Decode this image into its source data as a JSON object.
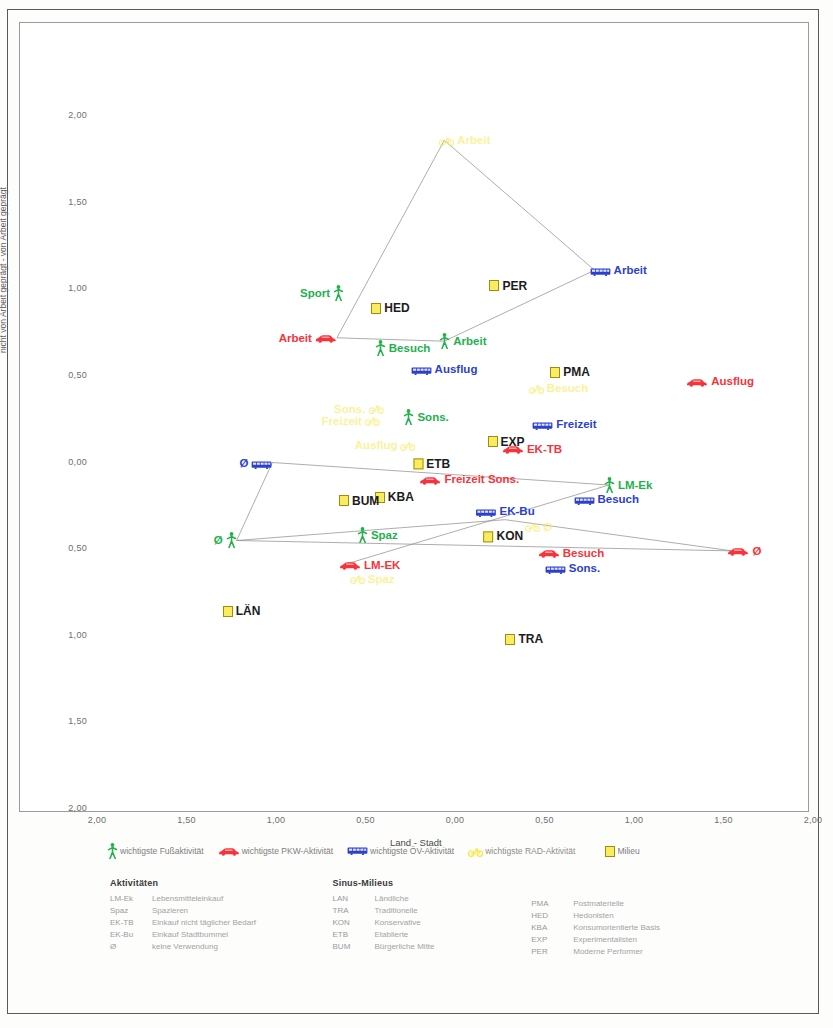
{
  "axes": {
    "x_label": "Land - Stadt",
    "y_label": "nicht von Arbeit geprägt - von Arbeit geprägt",
    "x_ticks": [
      "2,00",
      "1,50",
      "1,00",
      "0,50",
      "0,00",
      "0,50",
      "1,00",
      "1,50",
      "2,00"
    ],
    "y_ticks": [
      "2,00",
      "1,50",
      "1,00",
      "0,50",
      "0,00",
      "0,50",
      "1,00",
      "1,50",
      "2,00"
    ]
  },
  "legend": {
    "items": [
      {
        "icon": "pedestrian-icon",
        "label": "wichtigste Fußaktivität",
        "color": "#22b14c"
      },
      {
        "icon": "car-icon",
        "label": "wichtigste PKW-Aktivität",
        "color": "#f8333c"
      },
      {
        "icon": "bus-icon",
        "label": "wichtigste ÖV-Aktivität",
        "color": "#2b3fd0"
      },
      {
        "icon": "bicycle-icon",
        "label": "wichtigste RAD-Aktivität",
        "color": "#f7e84a"
      },
      {
        "icon": "yellow-square-icon",
        "label": "Milieu",
        "color": "#fbec5d"
      }
    ]
  },
  "tables": {
    "activities": {
      "title": "Aktivitäten",
      "rows": [
        {
          "key": "LM-Ek",
          "val": "Lebensmitteleinkauf"
        },
        {
          "key": "Spaz",
          "val": "Spazieren"
        },
        {
          "key": "EK-TB",
          "val": "Einkauf nicht täglicher Bedarf"
        },
        {
          "key": "EK-Bu",
          "val": "Einkauf Stadtbummel"
        },
        {
          "key": "Ø",
          "val": "keine Verwendung"
        }
      ]
    },
    "milieus": {
      "title": "Sinus-Milieus",
      "rows_left": [
        {
          "key": "LAN",
          "val": "Ländliche"
        },
        {
          "key": "TRA",
          "val": "Traditionelle"
        },
        {
          "key": "KON",
          "val": "Konservative"
        },
        {
          "key": "ETB",
          "val": "Etablierte"
        },
        {
          "key": "BUM",
          "val": "Bürgerliche Mitte"
        }
      ],
      "rows_right": [
        {
          "key": "PMA",
          "val": "Postmaterielle"
        },
        {
          "key": "HED",
          "val": "Hedonisten"
        },
        {
          "key": "KBA",
          "val": "Konsumorientierte Basis"
        },
        {
          "key": "EXP",
          "val": "Experimentalisten"
        },
        {
          "key": "PER",
          "val": "Moderne Performer"
        }
      ]
    }
  },
  "chart_data": {
    "type": "scatter",
    "title": "",
    "xlabel": "Land - Stadt",
    "ylabel": "nicht von Arbeit geprägt - von Arbeit geprägt",
    "xlim": [
      -2.0,
      2.0
    ],
    "ylim": [
      -2.0,
      2.0
    ],
    "grid": false,
    "note": "x axis runs Land(left,-2) to Stadt(right,+2); y axis runs von Arbeit geprägt(top,+2) to nicht von Arbeit geprägt(bottom,-2). Tick labels are printed as unsigned magnitudes on both sides of zero.",
    "series": [
      {
        "name": "wichtigste Fußaktivität",
        "icon": "pedestrian-icon",
        "color": "#22b14c",
        "points": [
          {
            "label": "Sport",
            "x": -0.62,
            "y": 0.98,
            "side": "left"
          },
          {
            "label": "Besuch",
            "x": -0.42,
            "y": 0.66,
            "side": "right"
          },
          {
            "label": "Arbeit",
            "x": -0.06,
            "y": 0.7,
            "side": "right"
          },
          {
            "label": "Sons.",
            "x": -0.26,
            "y": 0.26,
            "side": "right"
          },
          {
            "label": "LM-Ek",
            "x": 0.86,
            "y": -0.13,
            "side": "right"
          },
          {
            "label": "Spaz",
            "x": -0.52,
            "y": -0.42,
            "side": "right"
          },
          {
            "label": "Ø",
            "x": -1.22,
            "y": -0.45,
            "side": "left"
          }
        ]
      },
      {
        "name": "wichtigste PKW-Aktivität",
        "icon": "car-icon",
        "color": "#f8333c",
        "points": [
          {
            "label": "Arbeit",
            "x": -0.66,
            "y": 0.72,
            "side": "left"
          },
          {
            "label": "Ausflug",
            "x": 1.32,
            "y": 0.47,
            "side": "right"
          },
          {
            "label": "EK-TB",
            "x": 0.29,
            "y": 0.08,
            "side": "right"
          },
          {
            "label": "Freizeit Sons.",
            "x": 0.08,
            "y": -0.15,
            "side": "top"
          },
          {
            "label": "Besuch",
            "x": 0.49,
            "y": -0.52,
            "side": "right"
          },
          {
            "label": "Ø",
            "x": 1.55,
            "y": -0.51,
            "side": "right"
          },
          {
            "label": "LM-EK",
            "x": -0.62,
            "y": -0.59,
            "side": "right"
          }
        ]
      },
      {
        "name": "wichtigste ÖV-Aktivität",
        "icon": "bus-icon",
        "color": "#2b3fd0",
        "points": [
          {
            "label": "Arbeit",
            "x": 0.78,
            "y": 1.11,
            "side": "right"
          },
          {
            "label": "Ausflug",
            "x": -0.22,
            "y": 0.54,
            "side": "right"
          },
          {
            "label": "Freizeit",
            "x": 0.46,
            "y": 0.22,
            "side": "right"
          },
          {
            "label": "Ø",
            "x": -1.02,
            "y": 0.0,
            "side": "left"
          },
          {
            "label": "Besuch",
            "x": 0.69,
            "y": -0.21,
            "side": "right"
          },
          {
            "label": "EK-Bu",
            "x": 0.28,
            "y": -0.33,
            "side": "top"
          },
          {
            "label": "Sons.",
            "x": 0.53,
            "y": -0.61,
            "side": "right"
          }
        ]
      },
      {
        "name": "wichtigste RAD-Aktivität",
        "icon": "bicycle-icon",
        "color": "#f7e84a",
        "points": [
          {
            "label": "Arbeit",
            "x": -0.06,
            "y": 1.86,
            "side": "right"
          },
          {
            "label": "Besuch",
            "x": 0.44,
            "y": 0.43,
            "side": "right"
          },
          {
            "label": "Sons.",
            "x": -0.4,
            "y": 0.31,
            "side": "left"
          },
          {
            "label": "Freizeit",
            "x": -0.42,
            "y": 0.24,
            "side": "left"
          },
          {
            "label": "Ausflug",
            "x": -0.22,
            "y": 0.1,
            "side": "left"
          },
          {
            "label": "Ø",
            "x": 0.42,
            "y": -0.37,
            "side": "right"
          },
          {
            "label": "Spaz",
            "x": -0.56,
            "y": -0.67,
            "side": "right"
          }
        ]
      },
      {
        "name": "Milieu",
        "icon": "yellow-square-icon",
        "color": "#fbec5d",
        "points": [
          {
            "label": "PER",
            "x": 0.22,
            "y": 1.02,
            "side": "right"
          },
          {
            "label": "HED",
            "x": -0.44,
            "y": 0.89,
            "side": "right"
          },
          {
            "label": "PMA",
            "x": 0.56,
            "y": 0.52,
            "side": "right"
          },
          {
            "label": "EXP",
            "x": 0.21,
            "y": 0.12,
            "side": "right"
          },
          {
            "label": "ETB",
            "x": -0.13,
            "y": 0.04,
            "side": "bottom"
          },
          {
            "label": "KBA",
            "x": -0.42,
            "y": -0.2,
            "side": "right"
          },
          {
            "label": "BUM",
            "x": -0.62,
            "y": -0.22,
            "side": "right"
          },
          {
            "label": "KON",
            "x": 0.27,
            "y": -0.38,
            "side": "bottom"
          },
          {
            "label": "LÄN",
            "x": -1.27,
            "y": -0.86,
            "side": "right"
          },
          {
            "label": "TRA",
            "x": 0.31,
            "y": -1.02,
            "side": "right"
          }
        ]
      }
    ],
    "connector_paths": [
      {
        "name": "rad-link",
        "points": [
          [
            -0.06,
            1.86
          ],
          [
            -0.66,
            0.72
          ]
        ]
      },
      {
        "name": "rad-link2",
        "points": [
          [
            -0.06,
            1.86
          ],
          [
            0.78,
            1.11
          ]
        ]
      },
      {
        "name": "ov-link",
        "points": [
          [
            0.78,
            1.11
          ],
          [
            -0.06,
            0.7
          ]
        ]
      },
      {
        "name": "pkw-link",
        "points": [
          [
            -0.66,
            0.72
          ],
          [
            -0.06,
            0.7
          ]
        ]
      },
      {
        "name": "ov-zero-link",
        "points": [
          [
            -1.02,
            0.0
          ],
          [
            -1.22,
            -0.45
          ]
        ]
      },
      {
        "name": "ov-diag",
        "points": [
          [
            -1.02,
            0.0
          ],
          [
            0.86,
            -0.13
          ]
        ]
      },
      {
        "name": "fuss-diag",
        "points": [
          [
            -1.22,
            -0.45
          ],
          [
            1.55,
            -0.51
          ]
        ]
      },
      {
        "name": "cross-link",
        "points": [
          [
            -0.62,
            -0.59
          ],
          [
            0.86,
            -0.13
          ]
        ]
      },
      {
        "name": "cross-link2",
        "points": [
          [
            -1.22,
            -0.45
          ],
          [
            0.28,
            -0.33
          ]
        ]
      },
      {
        "name": "cross-link3",
        "points": [
          [
            0.28,
            -0.33
          ],
          [
            1.55,
            -0.51
          ]
        ]
      }
    ]
  }
}
